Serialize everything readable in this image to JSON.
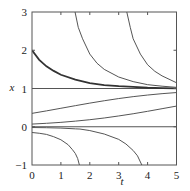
{
  "chart_data": {
    "type": "line",
    "title": "",
    "xlabel": "t",
    "ylabel": "x",
    "xlim": [
      0,
      5
    ],
    "ylim": [
      -1,
      3
    ],
    "grid": false,
    "legend": null,
    "x_ticks": [
      0,
      1,
      2,
      3,
      4,
      5
    ],
    "y_ticks": [
      -1,
      0,
      1,
      2,
      3
    ],
    "x_tick_labels": [
      "0",
      "1",
      "2",
      "3",
      "4",
      "5"
    ],
    "y_tick_labels": [
      "−1",
      "0",
      "1",
      "2",
      "3"
    ],
    "series": [
      {
        "name": "equilibrium x=1",
        "style": "normal",
        "points": [
          [
            0,
            1
          ],
          [
            5,
            1
          ]
        ]
      },
      {
        "name": "equilibrium x=0",
        "style": "normal",
        "points": [
          [
            0,
            0
          ],
          [
            5,
            0
          ]
        ]
      },
      {
        "name": "x0=2",
        "style": "thick",
        "points": [
          [
            0,
            2.0
          ],
          [
            0.25,
            1.75
          ],
          [
            0.5,
            1.58
          ],
          [
            0.75,
            1.46
          ],
          [
            1,
            1.36
          ],
          [
            1.5,
            1.23
          ],
          [
            2,
            1.14
          ],
          [
            2.5,
            1.09
          ],
          [
            3,
            1.06
          ],
          [
            3.5,
            1.04
          ],
          [
            4,
            1.02
          ],
          [
            4.5,
            1.01
          ],
          [
            5,
            1.005
          ]
        ]
      },
      {
        "name": "from above, enters t=1.5",
        "style": "normal",
        "points": [
          [
            1.49,
            3.0
          ],
          [
            1.6,
            2.6
          ],
          [
            1.75,
            2.3
          ],
          [
            2,
            1.9
          ],
          [
            2.25,
            1.66
          ],
          [
            2.5,
            1.5
          ],
          [
            3,
            1.3
          ],
          [
            3.5,
            1.18
          ],
          [
            4,
            1.1
          ],
          [
            4.5,
            1.06
          ],
          [
            5,
            1.03
          ]
        ]
      },
      {
        "name": "from above, enters t=3.3",
        "style": "normal",
        "points": [
          [
            3.28,
            3.0
          ],
          [
            3.4,
            2.6
          ],
          [
            3.5,
            2.3
          ],
          [
            3.75,
            1.9
          ],
          [
            4,
            1.62
          ],
          [
            4.25,
            1.45
          ],
          [
            4.5,
            1.33
          ],
          [
            5,
            1.15
          ]
        ]
      },
      {
        "name": "x0=0.35",
        "style": "normal",
        "points": [
          [
            0,
            0.35
          ],
          [
            0.5,
            0.415
          ],
          [
            1,
            0.483
          ],
          [
            1.5,
            0.551
          ],
          [
            2,
            0.618
          ],
          [
            2.5,
            0.68
          ],
          [
            3,
            0.737
          ],
          [
            3.5,
            0.787
          ],
          [
            4,
            0.829
          ],
          [
            4.5,
            0.865
          ],
          [
            5,
            0.894
          ]
        ]
      },
      {
        "name": "x0=0.07",
        "style": "normal",
        "points": [
          [
            0,
            0.07
          ],
          [
            0.5,
            0.09
          ],
          [
            1,
            0.115
          ],
          [
            1.5,
            0.147
          ],
          [
            2,
            0.184
          ],
          [
            2.5,
            0.229
          ],
          [
            3,
            0.282
          ],
          [
            3.5,
            0.34
          ],
          [
            4,
            0.404
          ],
          [
            4.5,
            0.472
          ],
          [
            5,
            0.54
          ]
        ]
      },
      {
        "name": "x0=-0.15",
        "style": "normal",
        "points": [
          [
            0,
            -0.15
          ],
          [
            0.25,
            -0.17
          ],
          [
            0.5,
            -0.2
          ],
          [
            0.75,
            -0.26
          ],
          [
            1,
            -0.34
          ],
          [
            1.25,
            -0.47
          ],
          [
            1.4,
            -0.6
          ],
          [
            1.5,
            -0.7
          ],
          [
            1.58,
            -0.83
          ],
          [
            1.64,
            -1.0
          ]
        ]
      },
      {
        "name": "x0=-0.02",
        "style": "normal",
        "points": [
          [
            0,
            -0.02
          ],
          [
            0.5,
            -0.025
          ],
          [
            1,
            -0.035
          ],
          [
            1.5,
            -0.055
          ],
          [
            1.66,
            -0.06
          ],
          [
            2,
            -0.1
          ],
          [
            2.5,
            -0.19
          ],
          [
            3,
            -0.33
          ],
          [
            3.25,
            -0.45
          ],
          [
            3.5,
            -0.62
          ],
          [
            3.65,
            -0.76
          ],
          [
            3.8,
            -1.0
          ]
        ]
      }
    ]
  }
}
